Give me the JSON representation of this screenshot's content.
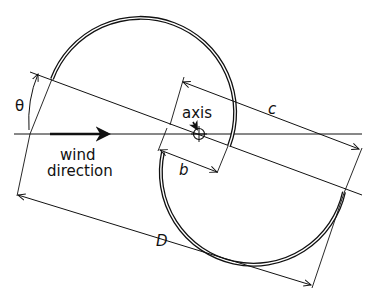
{
  "diagram": {
    "type": "savonius-rotor-geometry",
    "labels": {
      "theta": "θ",
      "axis": "axis",
      "c": "c",
      "b": "b",
      "D": "D",
      "wind_line1": "wind",
      "wind_line2": "direction"
    },
    "colors": {
      "ink": "#111111",
      "background": "#ffffff"
    },
    "elements": [
      "upper-semicircular-blade",
      "lower-semicircular-blade",
      "rotation-axis-marker",
      "wind-direction-arrow",
      "angle-theta-indicator",
      "dimension-c",
      "dimension-b",
      "dimension-D"
    ]
  }
}
